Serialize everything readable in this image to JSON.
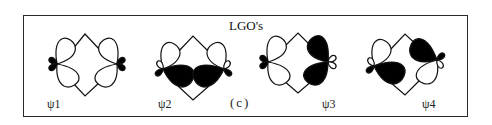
{
  "figure": {
    "title": "LGO's",
    "caption": "(c)",
    "colors": {
      "ink": "#111111",
      "filled": "#000000",
      "empty": "#ffffff",
      "frame": "#2a2a2a"
    },
    "orbitals": [
      {
        "label": "ψ1",
        "left_atom": {
          "big_upper": "white",
          "big_lower": "white",
          "small_upper": "black",
          "small_lower": "black"
        },
        "right_atom": {
          "big_upper": "white",
          "big_lower": "white",
          "small_upper": "black",
          "small_lower": "black"
        }
      },
      {
        "label": "ψ2",
        "left_atom": {
          "big_upper": "white",
          "big_lower": "black",
          "small_upper": "white",
          "small_lower": "black"
        },
        "right_atom": {
          "big_upper": "white",
          "big_lower": "black",
          "small_upper": "white",
          "small_lower": "black"
        }
      },
      {
        "label": "ψ3",
        "left_atom": {
          "big_upper": "white",
          "big_lower": "white",
          "small_upper": "black",
          "small_lower": "black"
        },
        "right_atom": {
          "big_upper": "black",
          "big_lower": "black",
          "small_upper": "white",
          "small_lower": "white"
        }
      },
      {
        "label": "ψ4",
        "left_atom": {
          "big_upper": "white",
          "big_lower": "black",
          "small_upper": "white",
          "small_lower": "black"
        },
        "right_atom": {
          "big_upper": "black",
          "big_lower": "white",
          "small_upper": "black",
          "small_lower": "white"
        }
      }
    ]
  }
}
